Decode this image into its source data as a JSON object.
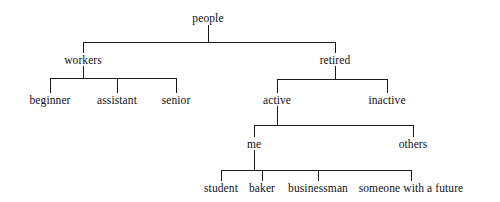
{
  "diagram": {
    "type": "tree",
    "background_color": "#ffffff",
    "line_color": "#1a1a1a",
    "text_color": "#111111",
    "nodes": [
      {
        "id": "people",
        "label": "people",
        "x": 208,
        "y": 18,
        "level": 0
      },
      {
        "id": "workers",
        "label": "workers",
        "x": 83,
        "y": 60,
        "level": 1
      },
      {
        "id": "retired",
        "label": "retired",
        "x": 335,
        "y": 60,
        "level": 1
      },
      {
        "id": "beginner",
        "label": "beginner",
        "x": 50,
        "y": 100,
        "level": 2
      },
      {
        "id": "assistant",
        "label": "assistant",
        "x": 117,
        "y": 100,
        "level": 2
      },
      {
        "id": "senior",
        "label": "senior",
        "x": 176,
        "y": 100,
        "level": 2
      },
      {
        "id": "active",
        "label": "active",
        "x": 277,
        "y": 100,
        "level": 2
      },
      {
        "id": "inactive",
        "label": "inactive",
        "x": 387,
        "y": 100,
        "level": 2
      },
      {
        "id": "me",
        "label": "me",
        "x": 254,
        "y": 144,
        "level": 3
      },
      {
        "id": "others",
        "label": "others",
        "x": 413,
        "y": 144,
        "level": 3
      },
      {
        "id": "student",
        "label": "student",
        "x": 221,
        "y": 188,
        "level": 4
      },
      {
        "id": "baker",
        "label": "baker",
        "x": 262,
        "y": 188,
        "level": 4
      },
      {
        "id": "businessman",
        "label": "businessman",
        "x": 318,
        "y": 188,
        "level": 4
      },
      {
        "id": "future",
        "label": "someone with a future",
        "x": 411,
        "y": 188,
        "level": 4
      }
    ],
    "edges": [
      {
        "from": "people",
        "to": "workers"
      },
      {
        "from": "people",
        "to": "retired"
      },
      {
        "from": "workers",
        "to": "beginner"
      },
      {
        "from": "workers",
        "to": "assistant"
      },
      {
        "from": "workers",
        "to": "senior"
      },
      {
        "from": "retired",
        "to": "active"
      },
      {
        "from": "retired",
        "to": "inactive"
      },
      {
        "from": "active",
        "to": "me"
      },
      {
        "from": "active",
        "to": "others"
      },
      {
        "from": "me",
        "to": "student"
      },
      {
        "from": "me",
        "to": "baker"
      },
      {
        "from": "me",
        "to": "businessman"
      },
      {
        "from": "me",
        "to": "future"
      }
    ],
    "connectors": [
      {
        "name": "people-stem",
        "x1": 208,
        "y1": 25,
        "x2": 208,
        "y2": 42
      },
      {
        "name": "people-bar",
        "x1": 83,
        "y1": 42,
        "x2": 335,
        "y2": 42
      },
      {
        "name": "workers-drop",
        "x1": 83,
        "y1": 42,
        "x2": 83,
        "y2": 53
      },
      {
        "name": "retired-drop",
        "x1": 335,
        "y1": 42,
        "x2": 335,
        "y2": 53
      },
      {
        "name": "workers-stem",
        "x1": 83,
        "y1": 66,
        "x2": 83,
        "y2": 78
      },
      {
        "name": "workers-bar",
        "x1": 50,
        "y1": 78,
        "x2": 176,
        "y2": 78
      },
      {
        "name": "beginner-drop",
        "x1": 50,
        "y1": 78,
        "x2": 50,
        "y2": 93
      },
      {
        "name": "assistant-drop",
        "x1": 117,
        "y1": 78,
        "x2": 117,
        "y2": 93
      },
      {
        "name": "senior-drop",
        "x1": 176,
        "y1": 78,
        "x2": 176,
        "y2": 93
      },
      {
        "name": "retired-stem",
        "x1": 335,
        "y1": 66,
        "x2": 335,
        "y2": 79
      },
      {
        "name": "retired-bar",
        "x1": 277,
        "y1": 79,
        "x2": 387,
        "y2": 79
      },
      {
        "name": "active-drop",
        "x1": 277,
        "y1": 79,
        "x2": 277,
        "y2": 93
      },
      {
        "name": "inactive-drop",
        "x1": 387,
        "y1": 79,
        "x2": 387,
        "y2": 93
      },
      {
        "name": "active-stem",
        "x1": 277,
        "y1": 106,
        "x2": 277,
        "y2": 125
      },
      {
        "name": "active-bar",
        "x1": 254,
        "y1": 125,
        "x2": 413,
        "y2": 125
      },
      {
        "name": "me-drop",
        "x1": 254,
        "y1": 125,
        "x2": 254,
        "y2": 137
      },
      {
        "name": "others-drop",
        "x1": 413,
        "y1": 125,
        "x2": 413,
        "y2": 137
      },
      {
        "name": "me-stem",
        "x1": 254,
        "y1": 150,
        "x2": 254,
        "y2": 170
      },
      {
        "name": "me-bar",
        "x1": 221,
        "y1": 170,
        "x2": 411,
        "y2": 170
      },
      {
        "name": "student-drop",
        "x1": 221,
        "y1": 170,
        "x2": 221,
        "y2": 181
      },
      {
        "name": "baker-drop",
        "x1": 262,
        "y1": 170,
        "x2": 262,
        "y2": 181
      },
      {
        "name": "businessman-drop",
        "x1": 318,
        "y1": 170,
        "x2": 318,
        "y2": 181
      },
      {
        "name": "future-drop",
        "x1": 411,
        "y1": 170,
        "x2": 411,
        "y2": 181
      }
    ]
  }
}
